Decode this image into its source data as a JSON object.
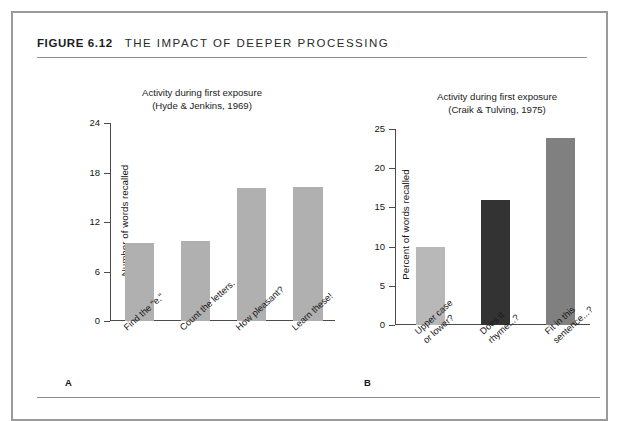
{
  "figure": {
    "number": "FIGURE 6.12",
    "title": "THE IMPACT OF DEEPER PROCESSING"
  },
  "panels": [
    {
      "letter": "A",
      "subtitle_line1": "Activity during first exposure",
      "subtitle_line2": "(Hyde & Jenkins, 1969)"
    },
    {
      "letter": "B",
      "subtitle_line1": "Activity during first exposure",
      "subtitle_line2": "(Craik & Tulving, 1975)"
    }
  ],
  "colors": {
    "frame": "#9a9a9a",
    "axis": "#4b4b4b",
    "bar_gray_a": "#b0b0b0",
    "bar_light": "#b8b8b8",
    "bar_dark": "#333333",
    "bar_medium": "#808080"
  },
  "chart_data": [
    {
      "type": "bar",
      "title": "Activity during first exposure",
      "subtitle": "(Hyde & Jenkins, 1969)",
      "panel": "A",
      "xlabel": "",
      "ylabel": "Number of words recalled",
      "ylim": [
        0,
        24
      ],
      "yticks": [
        0,
        6,
        12,
        18,
        24
      ],
      "ytick_labels": [
        "0",
        "6",
        "12",
        "18",
        "24"
      ],
      "grid": false,
      "legend": "none",
      "categories": [
        "Find the \"e.\"",
        "Count the letters.",
        "How pleasant?",
        "Learn these!"
      ],
      "values": [
        9.4,
        9.7,
        16.1,
        16.3
      ],
      "bar_colors": [
        "#b0b0b0",
        "#b0b0b0",
        "#b0b0b0",
        "#b0b0b0"
      ]
    },
    {
      "type": "bar",
      "title": "Activity during first exposure",
      "subtitle": "(Craik & Tulving, 1975)",
      "panel": "B",
      "xlabel": "",
      "ylabel": "Percent of words recalled",
      "ylim": [
        0,
        25
      ],
      "yticks": [
        0,
        5,
        10,
        15,
        20,
        25
      ],
      "ytick_labels": [
        "0",
        "5",
        "10",
        "15",
        "20",
        "25"
      ],
      "grid": false,
      "legend": "none",
      "categories": [
        "Upper case\nor lower?",
        "Does it\nrhyme...?",
        "Fit in this\nsentence...?"
      ],
      "values": [
        10.0,
        16.0,
        23.9
      ],
      "bar_colors": [
        "#b8b8b8",
        "#333333",
        "#808080"
      ]
    }
  ]
}
